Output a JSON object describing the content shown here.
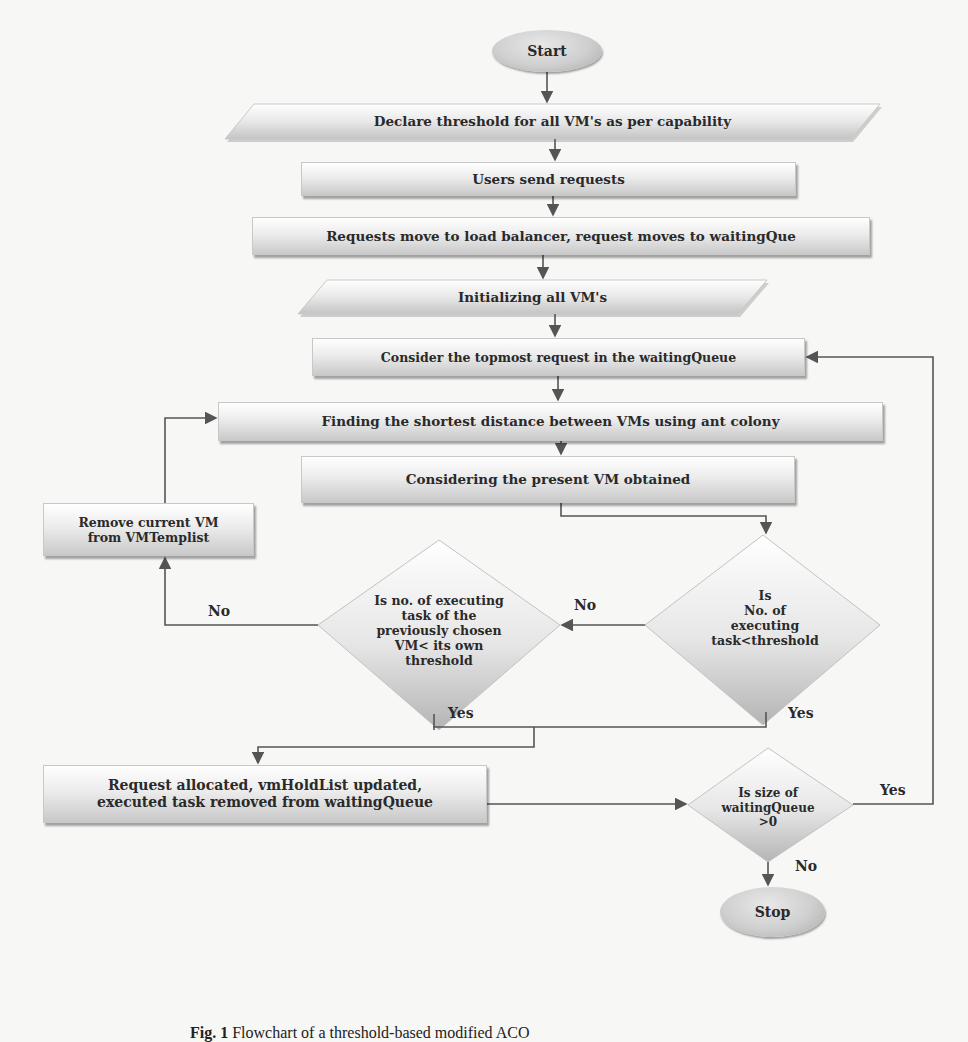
{
  "figure": {
    "caption_label": "Fig. 1",
    "caption_text": "Flowchart of a threshold-based modified ACO"
  },
  "nodes": {
    "start": "Start",
    "declare": "Declare threshold for all VM's as per capability",
    "users": "Users send requests",
    "requests_move": "Requests move to load balancer,  request moves to waitingQue",
    "initializing": "Initializing all VM's",
    "consider_topmost": "Consider the topmost request in the waitingQueue",
    "finding": "Finding the shortest distance between VMs using ant colony",
    "considering_present": "Considering the present VM obtained",
    "remove": [
      "Remove current VM",
      "from VMTemplist"
    ],
    "decision_prev": [
      "Is no. of executing",
      "task of the",
      "previously chosen",
      "VM< its own",
      "threshold"
    ],
    "decision_threshold": [
      "Is",
      "No. of",
      "executing",
      "task<threshold"
    ],
    "allocated": [
      "Request allocated, vmHoldList updated,",
      "executed task removed from waitingQueue"
    ],
    "decision_size": [
      "Is size of",
      "waitingQueue",
      ">0"
    ],
    "stop": "Stop"
  },
  "edge_labels": {
    "no_threshold": "No",
    "yes_threshold": "Yes",
    "no_prev": "No",
    "yes_prev": "Yes",
    "yes_size": "Yes",
    "no_size": "No"
  },
  "colors": {
    "line": "#555555",
    "shape_light": "#ececec",
    "shape_dark": "#b9b9b9",
    "background": "#f7f7f5"
  }
}
